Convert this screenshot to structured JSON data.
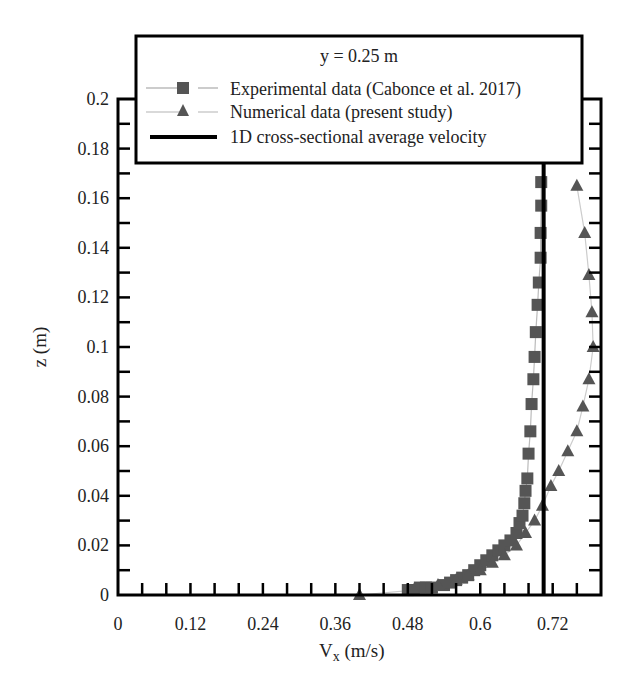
{
  "chart_data": {
    "type": "line",
    "title": "y = 0.25 m",
    "xlabel": "V_x (m/s)",
    "xlabel_main": "V",
    "xlabel_sub": "x",
    "xlabel_unit": " (m/s)",
    "ylabel": "z (m)",
    "xlim": [
      0,
      0.8
    ],
    "ylim": [
      0,
      0.2
    ],
    "x_ticks": [
      0,
      0.12,
      0.24,
      0.36,
      0.48,
      0.6,
      0.72
    ],
    "x_tick_labels": [
      "0",
      "0.12",
      "0.24",
      "0.36",
      "0.48",
      "0.6",
      "0.72"
    ],
    "x_minor_step": 0.04,
    "y_ticks": [
      0,
      0.02,
      0.04,
      0.06,
      0.08,
      0.1,
      0.12,
      0.14,
      0.16,
      0.18,
      0.2
    ],
    "y_tick_labels": [
      "0",
      "0.02",
      "0.04",
      "0.06",
      "0.08",
      "0.1",
      "0.12",
      "0.14",
      "0.16",
      "0.18",
      "0.2"
    ],
    "y_minor_step": 0.01,
    "grid": false,
    "legend_position": "top",
    "series": [
      {
        "name": "Experimental data (Cabonce et al. 2017)",
        "marker": "square",
        "color": "#555555",
        "line_color": "#bbbbbb",
        "x": [
          0.48,
          0.49,
          0.5,
          0.51,
          0.52,
          0.54,
          0.55,
          0.56,
          0.57,
          0.58,
          0.59,
          0.6,
          0.61,
          0.62,
          0.63,
          0.64,
          0.65,
          0.66,
          0.665,
          0.67,
          0.673,
          0.675,
          0.678,
          0.68,
          0.683,
          0.685,
          0.688,
          0.69,
          0.692,
          0.695,
          0.697,
          0.7,
          0.7
        ],
        "y": [
          0.002,
          0.002,
          0.003,
          0.003,
          0.003,
          0.004,
          0.005,
          0.006,
          0.007,
          0.008,
          0.01,
          0.012,
          0.014,
          0.016,
          0.018,
          0.02,
          0.022,
          0.025,
          0.029,
          0.032,
          0.037,
          0.042,
          0.047,
          0.057,
          0.066,
          0.077,
          0.087,
          0.096,
          0.106,
          0.117,
          0.126,
          0.136,
          0.146
        ]
      },
      {
        "name": "Numerical data (present study)",
        "marker": "triangle",
        "color": "#555555",
        "line_color": "#cccccc",
        "x": [
          0.4,
          0.49,
          0.53,
          0.56,
          0.58,
          0.6,
          0.62,
          0.64,
          0.66,
          0.675,
          0.69,
          0.703,
          0.717,
          0.73,
          0.745,
          0.76,
          0.77,
          0.78,
          0.787,
          0.785,
          0.78,
          0.773,
          0.76
        ],
        "y": [
          0.0,
          0.002,
          0.004,
          0.006,
          0.008,
          0.01,
          0.013,
          0.016,
          0.02,
          0.025,
          0.03,
          0.036,
          0.044,
          0.05,
          0.058,
          0.066,
          0.076,
          0.087,
          0.1,
          0.114,
          0.129,
          0.146,
          0.165
        ]
      },
      {
        "name": "1D cross-sectional average velocity",
        "marker": "none",
        "color": "#000000",
        "x": [
          0.705,
          0.705
        ],
        "y": [
          0,
          0.2
        ]
      }
    ]
  },
  "extra_experimental_top": {
    "x": [
      0.701,
      0.701
    ],
    "y": [
      0.157,
      0.1665
    ]
  }
}
